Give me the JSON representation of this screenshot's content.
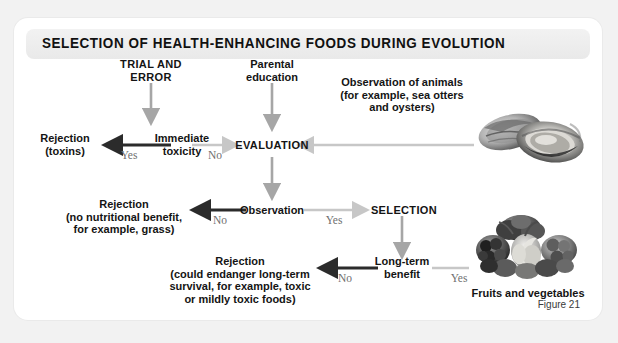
{
  "figure": {
    "title": "SELECTION OF HEALTH-ENHANCING FOODS DURING EVOLUTION",
    "caption": "Figure 21"
  },
  "nodes": {
    "trial_and_error": "TRIAL AND\nERROR",
    "parental_education": "Parental\neducation",
    "observation_of_animals": "Observation of animals\n(for example, sea otters\nand oysters)",
    "immediate_toxicity": "Immediate\ntoxicity",
    "evaluation": "EVALUATION",
    "rejection_toxins": "Rejection\n(toxins)",
    "observation": "Observation",
    "rejection_no_benefit": "Rejection\n(no nutritional benefit,\nfor example, grass)",
    "selection": "SELECTION",
    "long_term_benefit": "Long-term\nbenefit",
    "rejection_endanger": "Rejection\n(could endanger long-term\nsurvival, for example, toxic\nor mildly toxic foods)",
    "fruits_and_vegetables": "Fruits and vegetables"
  },
  "edge_labels": {
    "toxicity_yes": "Yes",
    "toxicity_no": "No",
    "observation_no": "No",
    "observation_yes": "Yes",
    "benefit_no": "No",
    "benefit_yes": "Yes"
  },
  "photos": {
    "oysters": "oysters-photo",
    "fruits_vegetables": "fruits-and-vegetables-photo"
  },
  "colors": {
    "arrow_dark": "#2b2b2b",
    "arrow_light": "#c9c9c9",
    "arrow_mid": "#9b9b9b",
    "text": "#141414",
    "label": "#6f6f6f",
    "card": "#ffffff",
    "page": "#f2f2f2",
    "band": "#ececec"
  }
}
